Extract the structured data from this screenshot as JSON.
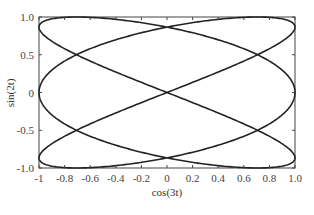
{
  "chart_data": {
    "type": "line",
    "title": "",
    "xlabel": "cos(3t)",
    "ylabel": "sin(2t)",
    "xlim": [
      -1,
      1
    ],
    "ylim": [
      -1,
      1
    ],
    "grid": false,
    "legend": null,
    "x_ticks": [
      -1,
      -0.8,
      -0.6,
      -0.4,
      -0.2,
      0,
      0.2,
      0.4,
      0.6,
      0.8,
      1.0
    ],
    "x_tick_labels": [
      "-1",
      "-0.8",
      "-0.6",
      "-0.4",
      "-0.2",
      "0",
      "0.2",
      "0.4",
      "0.6",
      "0.8",
      "1.0"
    ],
    "y_ticks": [
      -1,
      -0.5,
      0,
      0.5,
      1
    ],
    "y_tick_labels": [
      "-1.0",
      "-0.5",
      "0",
      "0.5",
      "1.0"
    ],
    "series": [
      {
        "name": "Lissajous curve",
        "x_expr": "cos(3t)",
        "y_expr": "sin(2t)",
        "t_range": [
          0,
          6.2832
        ],
        "color": "#222222"
      }
    ]
  },
  "frame": {
    "left": 39,
    "top": 17,
    "right": 295,
    "bottom": 168
  }
}
